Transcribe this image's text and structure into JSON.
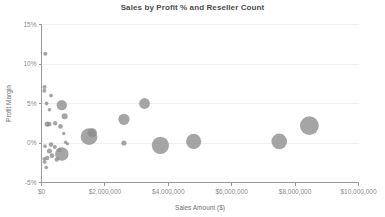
{
  "chart_data": {
    "type": "scatter",
    "title": "Sales by Profit % and Reseller Count",
    "xlabel": "Sales Amount ($)",
    "ylabel": "Profit Margin",
    "xlim": [
      0,
      10000000
    ],
    "ylim": [
      -0.05,
      0.15
    ],
    "grid": true,
    "legend": "none",
    "size_encoding": "Reseller Count",
    "bubble_color": "#8c8c8c",
    "xticks": [
      0,
      2000000,
      4000000,
      6000000,
      8000000,
      10000000
    ],
    "xtick_labels": [
      "$0",
      "$2,000,000",
      "$4,000,000",
      "$6,000,000",
      "$8,000,000",
      "$10,000,000"
    ],
    "yticks": [
      0.15,
      0.1,
      0.05,
      0.0,
      -0.05
    ],
    "ytick_labels": [
      "15%",
      "10%",
      "5%",
      "0%",
      "-5%"
    ],
    "points": [
      {
        "x": 120000,
        "y": 0.113,
        "r": 2.1
      },
      {
        "x": 95000,
        "y": 0.071,
        "r": 2.0
      },
      {
        "x": 90000,
        "y": 0.066,
        "r": 2.0
      },
      {
        "x": 300000,
        "y": 0.06,
        "r": 1.9
      },
      {
        "x": 160000,
        "y": 0.05,
        "r": 1.9
      },
      {
        "x": 640000,
        "y": 0.048,
        "r": 5.2
      },
      {
        "x": 250000,
        "y": 0.042,
        "r": 1.8
      },
      {
        "x": 730000,
        "y": 0.034,
        "r": 3.0
      },
      {
        "x": 180000,
        "y": 0.024,
        "r": 2.6
      },
      {
        "x": 240000,
        "y": 0.024,
        "r": 2.4
      },
      {
        "x": 430000,
        "y": 0.025,
        "r": 2.2
      },
      {
        "x": 600000,
        "y": 0.021,
        "r": 2.4
      },
      {
        "x": 700000,
        "y": 0.012,
        "r": 1.7
      },
      {
        "x": 1600000,
        "y": 0.013,
        "r": 4.6
      },
      {
        "x": 1500000,
        "y": 0.008,
        "r": 8.4
      },
      {
        "x": 2600000,
        "y": 0.03,
        "r": 5.6
      },
      {
        "x": 3250000,
        "y": 0.05,
        "r": 5.4
      },
      {
        "x": 2600000,
        "y": 0.0,
        "r": 2.6
      },
      {
        "x": 3750000,
        "y": -0.003,
        "r": 8.6
      },
      {
        "x": 4800000,
        "y": 0.002,
        "r": 7.6
      },
      {
        "x": 7500000,
        "y": 0.002,
        "r": 7.8
      },
      {
        "x": 8450000,
        "y": 0.022,
        "r": 9.4
      },
      {
        "x": 110000,
        "y": -0.004,
        "r": 1.8
      },
      {
        "x": 300000,
        "y": -0.002,
        "r": 2.3
      },
      {
        "x": 420000,
        "y": -0.005,
        "r": 2.0
      },
      {
        "x": 250000,
        "y": -0.01,
        "r": 2.5
      },
      {
        "x": 560000,
        "y": -0.009,
        "r": 2.0
      },
      {
        "x": 640000,
        "y": -0.014,
        "r": 6.8
      },
      {
        "x": 330000,
        "y": -0.016,
        "r": 2.4
      },
      {
        "x": 180000,
        "y": -0.019,
        "r": 2.2
      },
      {
        "x": 90000,
        "y": -0.02,
        "r": 1.9
      },
      {
        "x": 100000,
        "y": -0.024,
        "r": 1.9
      },
      {
        "x": 150000,
        "y": -0.031,
        "r": 1.8
      },
      {
        "x": 480000,
        "y": -0.021,
        "r": 2.2
      },
      {
        "x": 760000,
        "y": 0.001,
        "r": 1.7
      },
      {
        "x": 820000,
        "y": -0.001,
        "r": 1.6
      }
    ]
  }
}
